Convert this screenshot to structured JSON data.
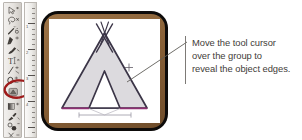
{
  "figure": {
    "kind": "software-tutorial-illustration",
    "background_color": "#ffffff"
  },
  "toolbar": {
    "name": "tool-palette",
    "selected_tool": "smart-guides-tool",
    "highlight_color": "#9e1b1b",
    "tools": [
      {
        "name": "direct-selection-tool",
        "glyph": "▷"
      },
      {
        "name": "lasso-tool",
        "glyph": "✂"
      },
      {
        "name": "magic-wand-tool",
        "glyph": "✦"
      },
      {
        "name": "pen-tool",
        "glyph": "✒"
      },
      {
        "name": "paintbrush-tool",
        "glyph": "✎"
      },
      {
        "name": "type-tool",
        "glyph": "T"
      },
      {
        "name": "line-segment-tool",
        "glyph": "╱"
      },
      {
        "name": "ellipse-tool",
        "glyph": "◯"
      },
      {
        "name": "rotate-tool",
        "glyph": "↻"
      },
      {
        "name": "free-transform-tool",
        "glyph": "▣"
      },
      {
        "name": "gradient-tool",
        "glyph": "▤"
      },
      {
        "name": "eyedropper-tool",
        "glyph": "⚘"
      },
      {
        "name": "blend-tool",
        "glyph": "❁"
      },
      {
        "name": "scissors-tool",
        "glyph": "✄"
      }
    ]
  },
  "ruler": {
    "name": "vertical-ruler",
    "orientation": "vertical",
    "labels": [
      "1",
      "2",
      "3",
      "4"
    ]
  },
  "canvas": {
    "name": "artboard",
    "frame_outer_color": "#0d0b0a",
    "frame_bevel_color": "#8a6238",
    "paper_color": "#ffffff",
    "artwork": {
      "name": "teepee-group",
      "fill_color": "#dcdade",
      "stroke_color": "#3b3547",
      "edge_highlight_color": "#8e2f72",
      "guide_color": "#9a97a3",
      "description": "teepee tent with crossed poles and triangular door"
    },
    "cursor": {
      "name": "tool-cursor",
      "glyph": "crosshair"
    }
  },
  "callout": {
    "name": "annotation-callout",
    "leader_color": "#5f5c58",
    "bracket_color": "#7d7a76",
    "text_lines": [
      "Move the tool cursor",
      "over the group to",
      "reveal the object edges."
    ],
    "text_full": "Move the tool cursor over the group to reveal the object edges."
  }
}
